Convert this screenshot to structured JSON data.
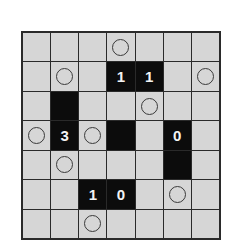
{
  "puzzle": {
    "type": "light-up",
    "rows": 7,
    "cols": 7,
    "colors": {
      "cell_background": "#d6d6d6",
      "black_cell": "#0c0c0c",
      "grid_line": "#2a2a2a",
      "number_text": "#f4f4f4",
      "circle_stroke": "#3a3a3a"
    },
    "cells": [
      [
        {
          "t": "empty"
        },
        {
          "t": "empty"
        },
        {
          "t": "empty"
        },
        {
          "t": "circle"
        },
        {
          "t": "empty"
        },
        {
          "t": "empty"
        },
        {
          "t": "empty"
        }
      ],
      [
        {
          "t": "empty"
        },
        {
          "t": "circle"
        },
        {
          "t": "empty"
        },
        {
          "t": "black",
          "n": "1"
        },
        {
          "t": "black",
          "n": "1"
        },
        {
          "t": "empty"
        },
        {
          "t": "circle"
        }
      ],
      [
        {
          "t": "empty"
        },
        {
          "t": "black",
          "n": ""
        },
        {
          "t": "empty"
        },
        {
          "t": "empty"
        },
        {
          "t": "circle"
        },
        {
          "t": "empty"
        },
        {
          "t": "empty"
        }
      ],
      [
        {
          "t": "circle"
        },
        {
          "t": "black",
          "n": "3"
        },
        {
          "t": "circle"
        },
        {
          "t": "black",
          "n": ""
        },
        {
          "t": "empty"
        },
        {
          "t": "black",
          "n": "0"
        },
        {
          "t": "empty"
        }
      ],
      [
        {
          "t": "empty"
        },
        {
          "t": "circle"
        },
        {
          "t": "empty"
        },
        {
          "t": "empty"
        },
        {
          "t": "empty"
        },
        {
          "t": "black",
          "n": ""
        },
        {
          "t": "empty"
        }
      ],
      [
        {
          "t": "empty"
        },
        {
          "t": "empty"
        },
        {
          "t": "black",
          "n": "1"
        },
        {
          "t": "black",
          "n": "0"
        },
        {
          "t": "empty"
        },
        {
          "t": "circle"
        },
        {
          "t": "empty"
        }
      ],
      [
        {
          "t": "empty"
        },
        {
          "t": "empty"
        },
        {
          "t": "circle"
        },
        {
          "t": "empty"
        },
        {
          "t": "empty"
        },
        {
          "t": "empty"
        },
        {
          "t": "empty"
        }
      ]
    ]
  }
}
